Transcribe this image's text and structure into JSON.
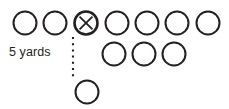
{
  "diagram": {
    "background_color": "#ffffff",
    "stroke_color": "#231f20",
    "distance_label": "5 yards",
    "line_of_scrimmage": {
      "name": "line-of-scrimmage",
      "style": "dotted",
      "x": 73,
      "y_start": 37,
      "y_end": 79
    },
    "circle_radius": 11.5,
    "rows": [
      {
        "name": "front-row",
        "y": 23,
        "players": [
          {
            "label": "",
            "cx": 25,
            "marked": false
          },
          {
            "label": "",
            "cx": 55,
            "marked": false
          },
          {
            "label": "X",
            "cx": 86,
            "marked": true
          },
          {
            "label": "",
            "cx": 117,
            "marked": false
          },
          {
            "label": "",
            "cx": 147,
            "marked": false
          },
          {
            "label": "",
            "cx": 177,
            "marked": false
          },
          {
            "label": "",
            "cx": 208,
            "marked": false
          }
        ]
      },
      {
        "name": "second-row",
        "y": 54,
        "players": [
          {
            "label": "",
            "cx": 114,
            "marked": false
          },
          {
            "label": "",
            "cx": 144,
            "marked": false
          },
          {
            "label": "",
            "cx": 174,
            "marked": false
          }
        ]
      },
      {
        "name": "back-row",
        "y": 92,
        "players": [
          {
            "label": "",
            "cx": 87,
            "marked": false
          }
        ]
      }
    ]
  }
}
